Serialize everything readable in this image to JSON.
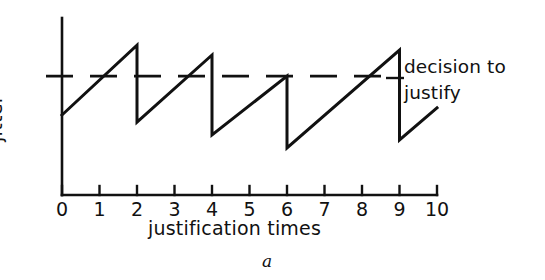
{
  "figure": {
    "caption": "a",
    "background_color": "#ffffff",
    "ink_color": "#111111"
  },
  "axes": {
    "x_title": "justification times",
    "y_title": "jitter",
    "x_ticks": [
      "0",
      "1",
      "2",
      "3",
      "4",
      "5",
      "6",
      "7",
      "8",
      "9",
      "10"
    ],
    "y_ticks": []
  },
  "annotations": {
    "threshold_line1": "decision to",
    "threshold_line2": "justify"
  },
  "chart_data": {
    "type": "line",
    "title": "",
    "subtitle": "",
    "xlabel": "justification times",
    "ylabel": "jitter",
    "xlim": [
      0,
      10
    ],
    "ylim": [
      0,
      1
    ],
    "grid": false,
    "legend": null,
    "x_ticks": [
      0,
      1,
      2,
      3,
      4,
      5,
      6,
      7,
      8,
      9,
      10
    ],
    "x_tick_labels": [
      "0",
      "1",
      "2",
      "3",
      "4",
      "5",
      "6",
      "7",
      "8",
      "9",
      "10"
    ],
    "y_tick_labels": [],
    "annotations": [
      {
        "text": "decision to justify",
        "type": "threshold-line",
        "style": "dashed",
        "y": 0.672,
        "x_start": 0.0,
        "x_end": 9.0
      }
    ],
    "series": [
      {
        "name": "jitter",
        "style": "solid",
        "comment": "sawtooth ramp: jitter accumulates then resets at each justification event",
        "points": [
          {
            "x": 0.0,
            "y": 0.452
          },
          {
            "x": 2.0,
            "y": 0.847
          },
          {
            "x": 2.0,
            "y": 0.412
          },
          {
            "x": 4.0,
            "y": 0.791
          },
          {
            "x": 4.0,
            "y": 0.339
          },
          {
            "x": 6.0,
            "y": 0.672
          },
          {
            "x": 6.0,
            "y": 0.266
          },
          {
            "x": 9.0,
            "y": 0.819
          },
          {
            "x": 9.0,
            "y": 0.311
          },
          {
            "x": 10.0,
            "y": 0.492
          }
        ],
        "reset_events_x": [
          2.0,
          4.0,
          6.0,
          9.0
        ],
        "peak_values": [
          0.847,
          0.791,
          0.672,
          0.819
        ]
      }
    ]
  }
}
